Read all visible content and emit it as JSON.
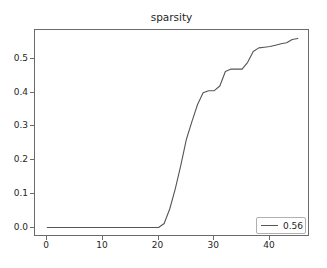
{
  "chart_data": {
    "type": "line",
    "title": "sparsity",
    "xlabel": "",
    "ylabel": "",
    "xlim": [
      -2.2,
      47.2
    ],
    "ylim": [
      -0.028,
      0.586
    ],
    "grid": false,
    "legend_position": "lower right",
    "xticks": [
      0,
      10,
      20,
      30,
      40
    ],
    "xtick_labels": [
      "0",
      "10",
      "20",
      "30",
      "40"
    ],
    "yticks": [
      0.0,
      0.1,
      0.2,
      0.3,
      0.4,
      0.5
    ],
    "ytick_labels": [
      "0.0",
      "0.1",
      "0.2",
      "0.3",
      "0.4",
      "0.5"
    ],
    "line_color": "#555555",
    "series": [
      {
        "name": "0.56",
        "x": [
          0,
          1,
          2,
          3,
          4,
          5,
          6,
          7,
          8,
          9,
          10,
          11,
          12,
          13,
          14,
          15,
          16,
          17,
          18,
          19,
          20,
          21,
          22,
          23,
          24,
          25,
          26,
          27,
          28,
          29,
          30,
          31,
          32,
          33,
          34,
          35,
          36,
          37,
          38,
          39,
          40,
          41,
          42,
          43,
          44,
          45
        ],
        "values": [
          0.0,
          0.0,
          0.0,
          0.0,
          0.0,
          0.0,
          0.0,
          0.0,
          0.0,
          0.0,
          0.0,
          0.0,
          0.0,
          0.0,
          0.0,
          0.0,
          0.0,
          0.0,
          0.0,
          0.0,
          0.0,
          0.012,
          0.055,
          0.115,
          0.185,
          0.262,
          0.315,
          0.365,
          0.4,
          0.406,
          0.406,
          0.42,
          0.463,
          0.47,
          0.47,
          0.47,
          0.49,
          0.522,
          0.533,
          0.535,
          0.537,
          0.541,
          0.545,
          0.548,
          0.558,
          0.561
        ]
      }
    ]
  },
  "legend": {
    "entries": [
      {
        "label": "0.56",
        "color": "#555555"
      }
    ]
  }
}
